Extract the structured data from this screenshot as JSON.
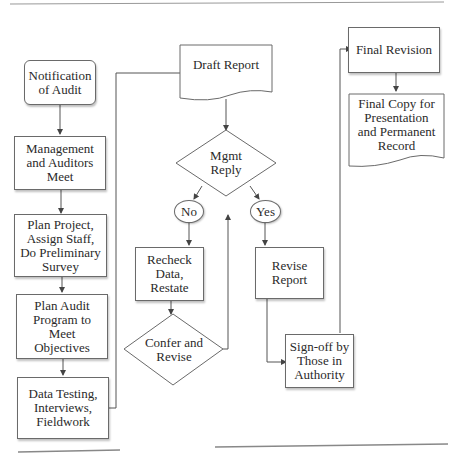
{
  "diagram": {
    "nodes": {
      "notification": "Notification\nof Audit",
      "meet": "Management\nand Auditors\nMeet",
      "plan_project": "Plan Project,\nAssign Staff,\nDo Preliminary\nSurvey",
      "plan_program": "Plan Audit\nProgram to\nMeet\nObjectives",
      "data_testing": "Data Testing,\nInterviews,\nFieldwork",
      "draft_report": "Draft Report",
      "mgmt_reply": "Mgmt\nReply",
      "no": "No",
      "yes": "Yes",
      "recheck": "Recheck\nData,\nRestate",
      "confer": "Confer and\nRevise",
      "revise_report": "Revise\nReport",
      "signoff": "Sign-off by\nThose in\nAuthority",
      "final_revision": "Final Revision",
      "final_copy": "Final Copy for\nPresentation\nand Permanent\nRecord"
    },
    "colors": {
      "line": "#555555",
      "border": "#6a6a6a",
      "text": "#2a2a2a",
      "background": "#ffffff"
    }
  }
}
